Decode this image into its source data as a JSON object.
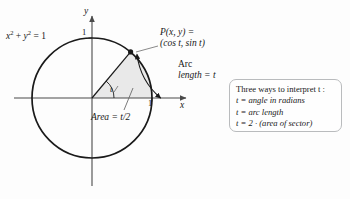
{
  "figure": {
    "title_equation": "x² + y² = 1",
    "axes": {
      "y_label": "y",
      "x_label": "x",
      "y_tick_label": "1",
      "x_tick_label": "1"
    },
    "angle_label": "t",
    "point": {
      "line1": "P(x, y) =",
      "line2": "(cos t, sin t)"
    },
    "arc": {
      "line1": "Arc",
      "line2": "length = t"
    },
    "area_label": "Area = t/2",
    "colors": {
      "stroke": "#1a1a1a",
      "axis": "#4a4a4a",
      "sector_fill": "#e9e9e9",
      "leader": "#6b6b6b",
      "box_border": "#b9bbbd",
      "background": "#fdfdfd"
    },
    "geometry": {
      "center_x": 92,
      "center_y": 98,
      "radius": 60,
      "angle_degrees": 50
    }
  },
  "callout": {
    "heading": "Three ways to interpret t :",
    "items": [
      "t = angle in radians",
      "t = arc length",
      "t = 2 · (area of sector)"
    ]
  }
}
